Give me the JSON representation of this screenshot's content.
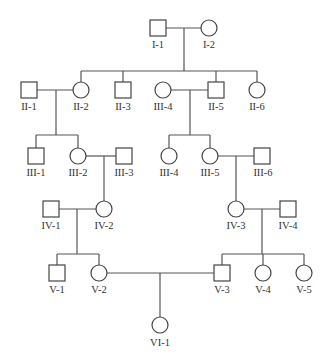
{
  "diagram": {
    "type": "pedigree-chart",
    "colors": {
      "line": "#555555",
      "shape_stroke": "#444444",
      "fill": "#ffffff",
      "text": "#333333"
    },
    "individuals": [
      {
        "id": "I-1",
        "sex": "male",
        "label": "I-1"
      },
      {
        "id": "I-2",
        "sex": "female",
        "label": "I-2"
      },
      {
        "id": "II-1",
        "sex": "male",
        "label": "II-1"
      },
      {
        "id": "II-2",
        "sex": "female",
        "label": "II-2"
      },
      {
        "id": "II-3",
        "sex": "male",
        "label": "II-3"
      },
      {
        "id": "III-4a",
        "sex": "female",
        "label": "III-4"
      },
      {
        "id": "II-5",
        "sex": "male",
        "label": "II-5"
      },
      {
        "id": "II-6",
        "sex": "female",
        "label": "II-6"
      },
      {
        "id": "III-1",
        "sex": "male",
        "label": "III-1"
      },
      {
        "id": "III-2",
        "sex": "female",
        "label": "III-2"
      },
      {
        "id": "III-3",
        "sex": "male",
        "label": "III-3"
      },
      {
        "id": "III-4b",
        "sex": "female",
        "label": "III-4"
      },
      {
        "id": "III-5",
        "sex": "female",
        "label": "III-5"
      },
      {
        "id": "III-6",
        "sex": "male",
        "label": "III-6"
      },
      {
        "id": "IV-1",
        "sex": "male",
        "label": "IV-1"
      },
      {
        "id": "IV-2",
        "sex": "female",
        "label": "IV-2"
      },
      {
        "id": "IV-3",
        "sex": "female",
        "label": "IV-3"
      },
      {
        "id": "IV-4",
        "sex": "male",
        "label": "IV-4"
      },
      {
        "id": "V-1",
        "sex": "male",
        "label": "V-1"
      },
      {
        "id": "V-2",
        "sex": "female",
        "label": "V-2"
      },
      {
        "id": "V-3",
        "sex": "male",
        "label": "V-3"
      },
      {
        "id": "V-4",
        "sex": "female",
        "label": "V-4"
      },
      {
        "id": "V-5",
        "sex": "female",
        "label": "V-5"
      },
      {
        "id": "VI-1",
        "sex": "female",
        "label": "VI-1"
      }
    ],
    "matings": [
      {
        "partners": [
          "I-1",
          "I-2"
        ],
        "children": [
          "II-2",
          "II-3",
          "II-5",
          "II-6"
        ]
      },
      {
        "partners": [
          "II-1",
          "II-2"
        ],
        "children": [
          "III-1",
          "III-2"
        ]
      },
      {
        "partners": [
          "III-4a",
          "II-5"
        ],
        "children": [
          "III-4b",
          "III-5"
        ]
      },
      {
        "partners": [
          "III-2",
          "III-3"
        ],
        "children": [
          "IV-2"
        ]
      },
      {
        "partners": [
          "III-5",
          "III-6"
        ],
        "children": [
          "IV-3"
        ]
      },
      {
        "partners": [
          "IV-1",
          "IV-2"
        ],
        "children": [
          "V-1",
          "V-2"
        ]
      },
      {
        "partners": [
          "IV-3",
          "IV-4"
        ],
        "children": [
          "V-3",
          "V-4",
          "V-5"
        ]
      },
      {
        "partners": [
          "V-2",
          "V-3"
        ],
        "children": [
          "VI-1"
        ]
      }
    ]
  }
}
